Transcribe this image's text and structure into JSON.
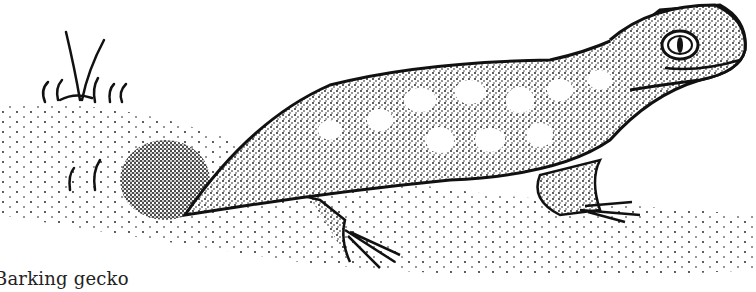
{
  "caption": "Barking gecko",
  "colors": {
    "ink": "#111111",
    "paper": "#ffffff"
  },
  "illustration": {
    "subject": "barking gecko",
    "style": "stipple pen-and-ink drawing",
    "elements": [
      "gecko-body",
      "gecko-head",
      "gecko-eye",
      "front-leg",
      "rear-leg",
      "tail-burrow",
      "ground",
      "grass-tufts"
    ]
  }
}
